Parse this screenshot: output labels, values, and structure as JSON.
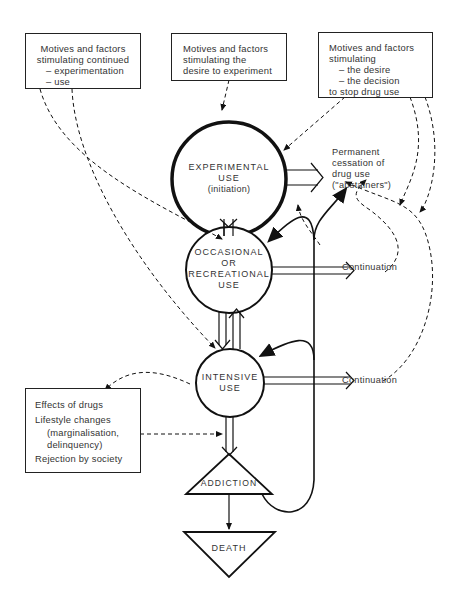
{
  "boxes": {
    "continued": {
      "title_1": "Motives and factors",
      "title_2": "stimulating continued",
      "item_1": "– experimentation",
      "item_2": "– use"
    },
    "experiment": {
      "line_1": "Motives and factors",
      "line_2": "stimulating the",
      "line_3": "desire to experiment"
    },
    "stop": {
      "line_1": "Motives and factors",
      "line_2": "stimulating",
      "item_1": "– the desire",
      "item_2": "– the decision",
      "line_3": "to stop drug use"
    },
    "effects": {
      "line_1": "Effects of drugs",
      "line_2": "Lifestyle changes",
      "line_3": "(marginalisation,",
      "line_4": "delinquency)",
      "line_5": "Rejection by society"
    }
  },
  "stages": {
    "experimental": {
      "line_1": "EXPERIMENTAL",
      "line_2": "USE",
      "line_3": "(initiation)"
    },
    "occasional": {
      "line_1": "OCCASIONAL",
      "line_2": "OR",
      "line_3": "RECREATIONAL",
      "line_4": "USE"
    },
    "intensive": {
      "line_1": "INTENSIVE",
      "line_2": "USE"
    },
    "addiction": {
      "label": "ADDICTION"
    },
    "death": {
      "label": "DEATH"
    }
  },
  "outcomes": {
    "cessation": {
      "line_1": "Permanent",
      "line_2": "cessation of",
      "line_3": "drug use",
      "line_4": "(\"abstainers\")"
    },
    "continuation_1": "Continuation",
    "continuation_2": "Continuation"
  },
  "colors": {
    "line": "#111111",
    "text": "#333333",
    "background": "#ffffff"
  }
}
